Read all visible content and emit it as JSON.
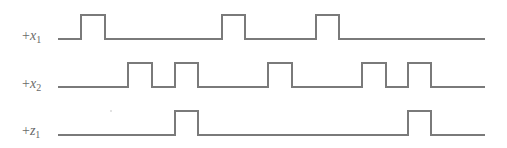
{
  "diagram": {
    "type": "timing-diagram",
    "line_color": "#7a7a7a",
    "label_color": "#6a6a6a",
    "x_start": 58,
    "x_end": 485,
    "signals": [
      {
        "id": "x1",
        "prefix": "+",
        "name": "x",
        "subscript": "1",
        "low_y": 39,
        "high_y": 15,
        "label_x": 22,
        "label_y": 29,
        "pulses": [
          [
            81,
            105
          ],
          [
            222,
            245
          ],
          [
            316,
            339
          ]
        ]
      },
      {
        "id": "x2",
        "prefix": "+",
        "name": "x",
        "subscript": "2",
        "low_y": 87,
        "high_y": 63,
        "label_x": 22,
        "label_y": 77,
        "pulses": [
          [
            128,
            152
          ],
          [
            175,
            198
          ],
          [
            268,
            292
          ],
          [
            362,
            386
          ],
          [
            408,
            431
          ]
        ]
      },
      {
        "id": "z1",
        "prefix": "+",
        "name": "z",
        "subscript": "1",
        "low_y": 135,
        "high_y": 111,
        "label_x": 22,
        "label_y": 124,
        "pulses": [
          [
            175,
            198
          ],
          [
            408,
            431
          ]
        ]
      }
    ]
  }
}
